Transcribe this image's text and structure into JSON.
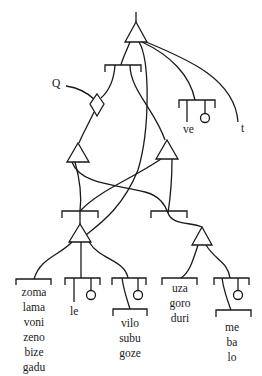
{
  "diagram": {
    "type": "semantic tree / network diagram",
    "labels": {
      "q": "Q",
      "ve": "ve",
      "t": "t",
      "le": "le"
    },
    "word_lists": {
      "list1": [
        "zoma",
        "lama",
        "voni",
        "zeno",
        "bize",
        "gadu"
      ],
      "list2": [
        "vilo",
        "subu",
        "goze"
      ],
      "list3": [
        "uza",
        "goro",
        "duri"
      ],
      "list4": [
        "me",
        "ba",
        "lo"
      ]
    },
    "colors": {
      "stroke": "#1a1a1a",
      "background": "#ffffff"
    }
  }
}
